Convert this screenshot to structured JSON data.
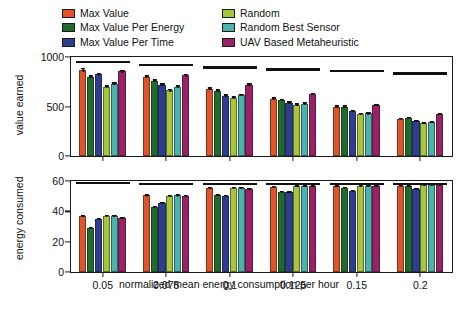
{
  "chart_data": {
    "type": "bar",
    "title": "",
    "xlabel": "normalized mean energy consumption per hour",
    "categories": [
      "0.05",
      "0.075",
      "0.1",
      "0.125",
      "0.15",
      "0.2"
    ],
    "legend_position": "top",
    "grid": false,
    "panels": [
      {
        "name": "value-earned-panel",
        "ylabel": "value earned",
        "ylim": [
          0,
          1000
        ],
        "yticks": [
          0,
          500,
          1000
        ],
        "ytick_labels": [
          "0",
          "500",
          "1000"
        ],
        "series": [
          {
            "name": "Max Value",
            "color": "#e1542a",
            "values": [
              870,
              800,
              680,
              580,
              500,
              375
            ],
            "errors": [
              18,
              16,
              14,
              12,
              12,
              10
            ]
          },
          {
            "name": "Max Value Per Energy",
            "color": "#1f6b2c",
            "values": [
              800,
              760,
              660,
              565,
              500,
              385
            ],
            "errors": [
              16,
              15,
              14,
              12,
              12,
              10
            ]
          },
          {
            "name": "Max Value Per Time",
            "color": "#2e3c91",
            "values": [
              825,
              720,
              610,
              540,
              455,
              355
            ],
            "errors": [
              16,
              15,
              13,
              12,
              11,
              10
            ]
          },
          {
            "name": "Random",
            "color": "#a6c639",
            "values": [
              700,
              665,
              590,
              520,
              425,
              330
            ],
            "errors": [
              15,
              14,
              13,
              11,
              11,
              9
            ]
          },
          {
            "name": "Random Best Sensor",
            "color": "#49b3ad",
            "values": [
              730,
              700,
              615,
              530,
              430,
              340
            ],
            "errors": [
              15,
              14,
              13,
              11,
              11,
              9
            ]
          },
          {
            "name": "UAV Based Metaheuristic",
            "color": "#9b2167",
            "values": [
              855,
              815,
              720,
              625,
              512,
              420
            ],
            "errors": [
              17,
              16,
              14,
              12,
              12,
              10
            ]
          }
        ],
        "reference_lines": [
          960,
          930,
          905,
          885,
          872,
          845
        ]
      },
      {
        "name": "energy-consumed-panel",
        "ylabel": "energy consumed",
        "ylim": [
          0,
          60
        ],
        "yticks": [
          0,
          20,
          40,
          60
        ],
        "ytick_labels": [
          "0",
          "20",
          "40",
          "60"
        ],
        "series": [
          {
            "name": "Max Value",
            "color": "#e1542a",
            "values": [
              37.0,
              50.5,
              55.5,
              56.0,
              56.5,
              57.0
            ],
            "errors": [
              0.8,
              0.8,
              0.7,
              0.7,
              0.7,
              0.7
            ]
          },
          {
            "name": "Max Value Per Energy",
            "color": "#1f6b2c",
            "values": [
              29.0,
              43.0,
              50.5,
              53.0,
              55.5,
              56.5
            ],
            "errors": [
              0.8,
              0.8,
              0.7,
              0.7,
              0.7,
              0.7
            ]
          },
          {
            "name": "Max Value Per Time",
            "color": "#2e3c91",
            "values": [
              35.0,
              45.5,
              50.0,
              52.5,
              53.5,
              55.0
            ],
            "errors": [
              0.8,
              0.8,
              0.7,
              0.7,
              0.7,
              0.7
            ]
          },
          {
            "name": "Random",
            "color": "#a6c639",
            "values": [
              37.0,
              50.0,
              55.5,
              56.5,
              57.0,
              57.5
            ],
            "errors": [
              0.8,
              0.8,
              0.7,
              0.7,
              0.7,
              0.7
            ]
          },
          {
            "name": "Random Best Sensor",
            "color": "#49b3ad",
            "values": [
              37.0,
              50.5,
              55.5,
              56.5,
              57.0,
              57.5
            ],
            "errors": [
              0.8,
              0.8,
              0.7,
              0.7,
              0.7,
              0.7
            ]
          },
          {
            "name": "UAV Based Metaheuristic",
            "color": "#9b2167",
            "values": [
              35.5,
              50.0,
              55.0,
              56.5,
              57.0,
              57.5
            ],
            "errors": [
              0.8,
              0.8,
              0.7,
              0.7,
              0.7,
              0.7
            ]
          }
        ],
        "reference_lines": [
          59.5,
          59.0,
          58.5,
          58.5,
          58.5,
          58.5
        ]
      }
    ],
    "legend": [
      {
        "label": "Max Value",
        "color": "#e1542a"
      },
      {
        "label": "Max Value Per Energy",
        "color": "#1f6b2c"
      },
      {
        "label": "Max Value Per Time",
        "color": "#2e3c91"
      },
      {
        "label": "Random",
        "color": "#a6c639"
      },
      {
        "label": "Random Best Sensor",
        "color": "#49b3ad"
      },
      {
        "label": "UAV Based Metaheuristic",
        "color": "#9b2167"
      }
    ]
  }
}
